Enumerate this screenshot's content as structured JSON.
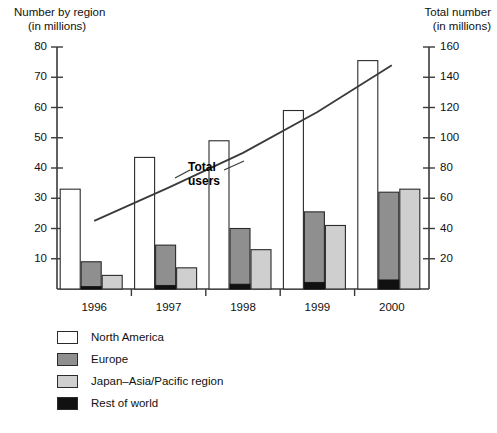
{
  "chart_data": {
    "type": "bar",
    "title": "",
    "subtitle": "",
    "categories": [
      "1996",
      "1997",
      "1998",
      "1999",
      "2000"
    ],
    "series": [
      {
        "name": "North America",
        "values": [
          33,
          43.5,
          49,
          59,
          75.5
        ],
        "color": "#ffffff",
        "axis": "left"
      },
      {
        "name": "Europe",
        "values": [
          9,
          14.5,
          20,
          25.5,
          32
        ],
        "color": "#8f8f8f",
        "axis": "left"
      },
      {
        "name": "Japan–Asia/Pacific region",
        "values": [
          4.5,
          7,
          13,
          21,
          33
        ],
        "color": "#cfcfcf",
        "axis": "left"
      },
      {
        "name": "Rest of world",
        "values": [
          0.8,
          1.2,
          1.6,
          2.2,
          3
        ],
        "color": "#111111",
        "axis": "left"
      }
    ],
    "line_series": {
      "name": "Total users",
      "values": [
        45,
        67,
        90,
        117,
        148
      ],
      "axis": "right",
      "color": "#3a3a3a"
    },
    "xlabel": "",
    "ylabel": "Number by region\n(in millions)",
    "y2label": "Total number\n(in millions)",
    "ylim": [
      0,
      80
    ],
    "y2lim": [
      0,
      160
    ],
    "yticks": [
      10,
      20,
      30,
      40,
      50,
      60,
      70,
      80
    ],
    "y2ticks": [
      20,
      40,
      60,
      80,
      100,
      120,
      140,
      160
    ],
    "grid": false,
    "legend_position": "below"
  },
  "axes": {
    "left_title_line1": "Number by region",
    "left_title_line2": "(in millions)",
    "right_title_line1": "Total number",
    "right_title_line2": "(in millions)"
  },
  "annotations": {
    "total_users_line1": "Total",
    "total_users_line2": "users"
  },
  "legend": {
    "items": [
      {
        "label": "North America",
        "swatch": "white-swatch"
      },
      {
        "label": "Europe",
        "swatch": "dark-gray-swatch"
      },
      {
        "label": "Japan–Asia/Pacific region",
        "swatch": "light-gray-swatch"
      },
      {
        "label": "Rest of world",
        "swatch": "black-swatch"
      }
    ]
  },
  "caption": {
    "text": ""
  }
}
